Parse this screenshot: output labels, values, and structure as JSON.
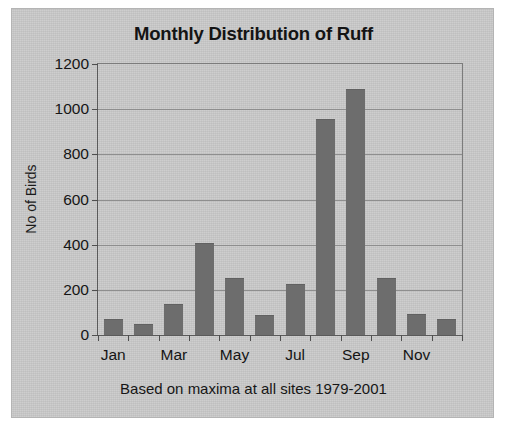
{
  "chart_data": {
    "type": "bar",
    "title": "Monthly Distribution of Ruff",
    "xlabel": "Based on maxima at all sites 1979-2001",
    "ylabel": "No of Birds",
    "categories": [
      "Jan",
      "Feb",
      "Mar",
      "Apr",
      "May",
      "Jun",
      "Jul",
      "Aug",
      "Sep",
      "Oct",
      "Nov",
      "Dec"
    ],
    "visible_tick_labels": [
      "Jan",
      "",
      "Mar",
      "",
      "May",
      "",
      "Jul",
      "",
      "Sep",
      "",
      "Nov",
      ""
    ],
    "values": [
      65,
      45,
      133,
      405,
      250,
      82,
      222,
      950,
      1085,
      248,
      90,
      68
    ],
    "ylim": [
      0,
      1200
    ],
    "yticks": [
      0,
      200,
      400,
      600,
      800,
      1000,
      1200
    ],
    "ytick_labels": [
      "0",
      "200",
      "400",
      "600",
      "800",
      "1000",
      "1200"
    ],
    "grid": true,
    "grid_axis": "y",
    "legend": false,
    "series": [
      {
        "name": "No of Birds",
        "values": [
          65,
          45,
          133,
          405,
          250,
          82,
          222,
          950,
          1085,
          248,
          90,
          68
        ]
      }
    ],
    "colors": {
      "bar": "#6d6d6d",
      "plot_background": "#cacaca",
      "grid": "#8e8e8e",
      "axis": "#4f4f4f",
      "text": "#151515"
    }
  }
}
